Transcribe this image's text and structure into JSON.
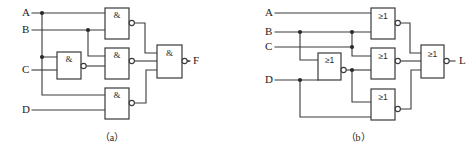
{
  "figure": {
    "kind": "logic-circuit-diagram",
    "line_color": "#3a3a3a",
    "text_color": "#1c1c1c",
    "background": "#ffffff"
  },
  "circuits": [
    {
      "id": "a",
      "caption": "（a）",
      "gate_symbol": "&",
      "gate_type": "NAND",
      "inputs": [
        {
          "label": "A",
          "x": 22,
          "y": 13
        },
        {
          "label": "B",
          "x": 22,
          "y": 30
        },
        {
          "label": "C",
          "x": 22,
          "y": 70
        },
        {
          "label": "D",
          "x": 22,
          "y": 105
        }
      ],
      "outputs": [
        {
          "label": "F",
          "x": 193,
          "y": 61
        }
      ],
      "gates": [
        {
          "name": "nand-gate-ab",
          "symbol": "&",
          "x": 105,
          "y": 8,
          "w": 24,
          "h": 31
        },
        {
          "name": "nand-gate-c",
          "symbol": "&",
          "x": 57,
          "y": 52,
          "w": 24,
          "h": 27
        },
        {
          "name": "nand-gate-mid",
          "symbol": "&",
          "x": 105,
          "y": 48,
          "w": 24,
          "h": 31
        },
        {
          "name": "nand-gate-bot",
          "symbol": "&",
          "x": 105,
          "y": 88,
          "w": 24,
          "h": 31
        },
        {
          "name": "nand-gate-out",
          "symbol": "&",
          "x": 157,
          "y": 45,
          "w": 25,
          "h": 33
        }
      ]
    },
    {
      "id": "b",
      "caption": "（b）",
      "gate_symbol": "≥1",
      "gate_type": "NOR",
      "inputs": [
        {
          "label": "A",
          "x": 265,
          "y": 13
        },
        {
          "label": "B",
          "x": 265,
          "y": 32
        },
        {
          "label": "C",
          "x": 265,
          "y": 47
        },
        {
          "label": "D",
          "x": 265,
          "y": 80
        }
      ],
      "outputs": [
        {
          "label": "L",
          "x": 459,
          "y": 61
        }
      ],
      "gates": [
        {
          "name": "nor-gate-top",
          "symbol": "≥1",
          "x": 371,
          "y": 8,
          "w": 24,
          "h": 31
        },
        {
          "name": "nor-gate-d",
          "symbol": "≥1",
          "x": 318,
          "y": 53,
          "w": 23,
          "h": 27
        },
        {
          "name": "nor-gate-mid",
          "symbol": "≥1",
          "x": 371,
          "y": 48,
          "w": 24,
          "h": 31
        },
        {
          "name": "nor-gate-bot",
          "symbol": "≥1",
          "x": 371,
          "y": 89,
          "w": 24,
          "h": 31
        },
        {
          "name": "nor-gate-out",
          "symbol": "≥1",
          "x": 421,
          "y": 45,
          "w": 23,
          "h": 33
        }
      ]
    }
  ],
  "captions": {
    "left": "（a）",
    "right": "（b）",
    "left_x": 112,
    "right_x": 358,
    "y": 139
  }
}
